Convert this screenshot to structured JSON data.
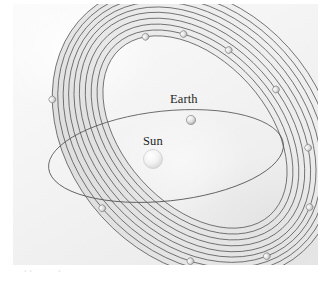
{
  "figure": {
    "kind": "astronomy-orbit-diagram",
    "panel": {
      "background_color": "#f2f2f2",
      "width": 305,
      "height": 261
    },
    "labels": {
      "earth": "Earth",
      "sun": "Sun"
    },
    "caption_sliver": "clipped caption text"
  },
  "chart_data": {
    "type": "scatter",
    "xlabel": "",
    "ylabel": "",
    "legend_position": "none",
    "grid": false,
    "annotations": [
      "Earth",
      "Sun"
    ],
    "bodies": [
      {
        "name": "Sun",
        "label": "Sun",
        "cx": 140,
        "cy": 155,
        "r": 9.5,
        "color": "#f0f0f0",
        "on_orbit": "none"
      },
      {
        "name": "Earth",
        "label": "Earth",
        "cx": 178,
        "cy": 116,
        "r": 4.6,
        "color": "#e2e2e2",
        "on_orbit": "earth-orbit"
      }
    ],
    "earth_orbit": {
      "name": "earth-orbit",
      "rx": 118,
      "ry": 45,
      "cx": 153,
      "cy": 152,
      "rotation_deg": -6,
      "stroke": "#5a5a5a",
      "stroke_width": 0.8
    },
    "orbit_family": {
      "count": 10,
      "description": "Nested elongated ellipses sharing a common focus at the Sun, steeply inclined to the ecliptic plane",
      "rotation_deg": -42,
      "cx": 182,
      "cy": 128,
      "stroke": "#4a4a4a",
      "stroke_width": 0.7,
      "shell_fill": "#dedede",
      "members": [
        {
          "index": 1,
          "rx": 72,
          "ry": 112,
          "marker": {
            "t_deg": 22,
            "r": 3.4
          }
        },
        {
          "index": 2,
          "rx": 78,
          "ry": 118,
          "marker": {
            "t_deg": 47,
            "r": 3.4
          }
        },
        {
          "index": 3,
          "rx": 84,
          "ry": 124,
          "marker": {
            "t_deg": 72,
            "r": 3.4
          }
        },
        {
          "index": 4,
          "rx": 90,
          "ry": 130,
          "marker": {
            "t_deg": 100,
            "r": 3.4
          }
        },
        {
          "index": 5,
          "rx": 96,
          "ry": 136,
          "marker": {
            "t_deg": 130,
            "r": 3.4
          }
        },
        {
          "index": 6,
          "rx": 102,
          "ry": 141,
          "marker": {
            "t_deg": 160,
            "r": 3.4
          }
        },
        {
          "index": 7,
          "rx": 108,
          "ry": 146,
          "marker": {
            "t_deg": 196,
            "r": 3.4
          }
        },
        {
          "index": 8,
          "rx": 114,
          "ry": 151,
          "marker": {
            "t_deg": 232,
            "r": 3.4
          }
        },
        {
          "index": 9,
          "rx": 120,
          "ry": 156,
          "marker": {
            "t_deg": 272,
            "r": 3.4
          }
        },
        {
          "index": 10,
          "rx": 126,
          "ry": 161,
          "marker": {
            "t_deg": 318,
            "r": 3.4
          }
        }
      ]
    }
  }
}
